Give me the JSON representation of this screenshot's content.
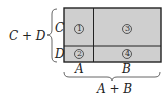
{
  "diagram": {
    "type": "area-model-rectangle",
    "fill_color": "#cfcfcf",
    "border_color": "#222222",
    "rows": [
      {
        "label": "C"
      },
      {
        "label": "D"
      }
    ],
    "columns": [
      {
        "label": "A"
      },
      {
        "label": "B"
      }
    ],
    "regions": [
      {
        "id": "1",
        "row": "C",
        "col": "A"
      },
      {
        "id": "2",
        "row": "D",
        "col": "A"
      },
      {
        "id": "3",
        "row": "C",
        "col": "B"
      },
      {
        "id": "4",
        "row": "D",
        "col": "B"
      }
    ],
    "left_brace_label": "C + D",
    "bottom_brace_label": "A + B"
  }
}
